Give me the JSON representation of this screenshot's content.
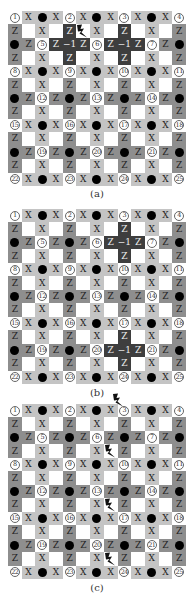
{
  "figure": {
    "grid_size": 13,
    "colors": {
      "white": "#ffffff",
      "x_cell": "#c4c4c4",
      "z_cell": "#8e8e8e",
      "highlight": "#3e3e3e",
      "dot": "#000000"
    },
    "labels": {
      "x": "X",
      "z": "Z",
      "minus_one": "−1"
    },
    "site_numbers": [
      "①",
      "②",
      "③",
      "④",
      "⑤",
      "⑥",
      "⑦",
      "⑧",
      "⑨",
      "⑩",
      "⑪",
      "⑫",
      "⑬",
      "⑭",
      "⑮",
      "⑯",
      "⑰",
      "⑱",
      "⑲",
      "⑳",
      "㉑",
      "㉒",
      "㉓",
      "㉔",
      "㉕"
    ]
  },
  "panels": [
    {
      "id": "a",
      "caption": "(a)",
      "top": 11,
      "caption_top": 188,
      "highlights": [
        [
          2,
          4
        ],
        [
          2,
          8
        ]
      ],
      "bolts": [
        [
          1,
          5
        ]
      ]
    },
    {
      "id": "b",
      "caption": "(b)",
      "top": 209,
      "caption_top": 387,
      "highlights": [
        [
          2,
          8
        ],
        [
          10,
          8
        ]
      ],
      "bolts": []
    },
    {
      "id": "c",
      "caption": "(c)",
      "top": 404,
      "caption_top": 582,
      "highlights": [],
      "bolts": [
        [
          -0.8,
          7.6
        ],
        [
          3,
          7
        ],
        [
          7,
          7
        ],
        [
          11,
          7
        ]
      ]
    }
  ]
}
